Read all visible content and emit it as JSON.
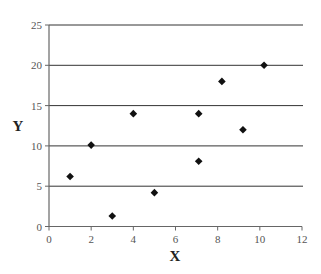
{
  "chart_data": {
    "type": "scatter",
    "title": "",
    "xlabel": "X",
    "ylabel": "Y",
    "xlim": [
      0,
      12
    ],
    "ylim": [
      0,
      25
    ],
    "x_ticks": [
      0,
      2,
      4,
      6,
      8,
      10,
      12
    ],
    "y_ticks": [
      0,
      5,
      10,
      15,
      20,
      25
    ],
    "grid": {
      "horizontal": true,
      "vertical": false
    },
    "legend": null,
    "marker": "diamond",
    "series": [
      {
        "name": "",
        "color": "#111111",
        "points": [
          {
            "x": 1,
            "y": 6.2
          },
          {
            "x": 2,
            "y": 10.1
          },
          {
            "x": 3,
            "y": 1.3
          },
          {
            "x": 4,
            "y": 14
          },
          {
            "x": 5,
            "y": 4.2
          },
          {
            "x": 7.1,
            "y": 14
          },
          {
            "x": 7.1,
            "y": 8.1
          },
          {
            "x": 8.2,
            "y": 18
          },
          {
            "x": 9.2,
            "y": 12
          },
          {
            "x": 10.2,
            "y": 20
          }
        ]
      }
    ]
  },
  "colors": {
    "axis": "#666666",
    "grid": "#333333",
    "marker": "#111111"
  }
}
